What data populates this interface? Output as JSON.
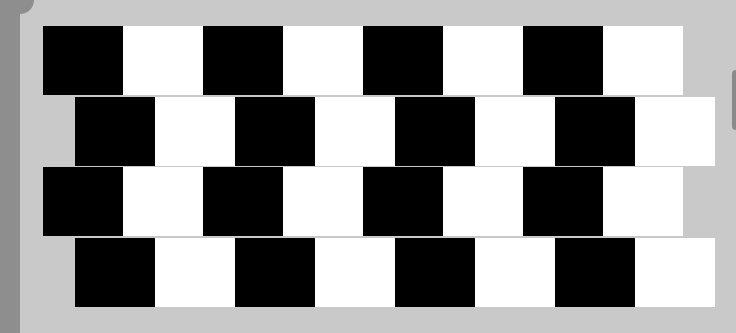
{
  "image": {
    "subject": "Café wall illusion",
    "background_color": "#c9c9c9",
    "mortar_color": "#c9c9c9",
    "tile_colors": [
      "#000000",
      "#ffffff"
    ],
    "rows": [
      {
        "offset_x": 43,
        "top": 26,
        "tiles": [
          "black",
          "white",
          "black",
          "white",
          "black",
          "white",
          "black",
          "white"
        ]
      },
      {
        "offset_x": 75,
        "top": 97,
        "tiles": [
          "black",
          "white",
          "black",
          "white",
          "black",
          "white",
          "black",
          "white"
        ]
      },
      {
        "offset_x": 43,
        "top": 167,
        "tiles": [
          "black",
          "white",
          "black",
          "white",
          "black",
          "white",
          "black",
          "white"
        ]
      },
      {
        "offset_x": 75,
        "top": 238,
        "tiles": [
          "black",
          "white",
          "black",
          "white",
          "black",
          "white",
          "black",
          "white"
        ]
      }
    ]
  }
}
